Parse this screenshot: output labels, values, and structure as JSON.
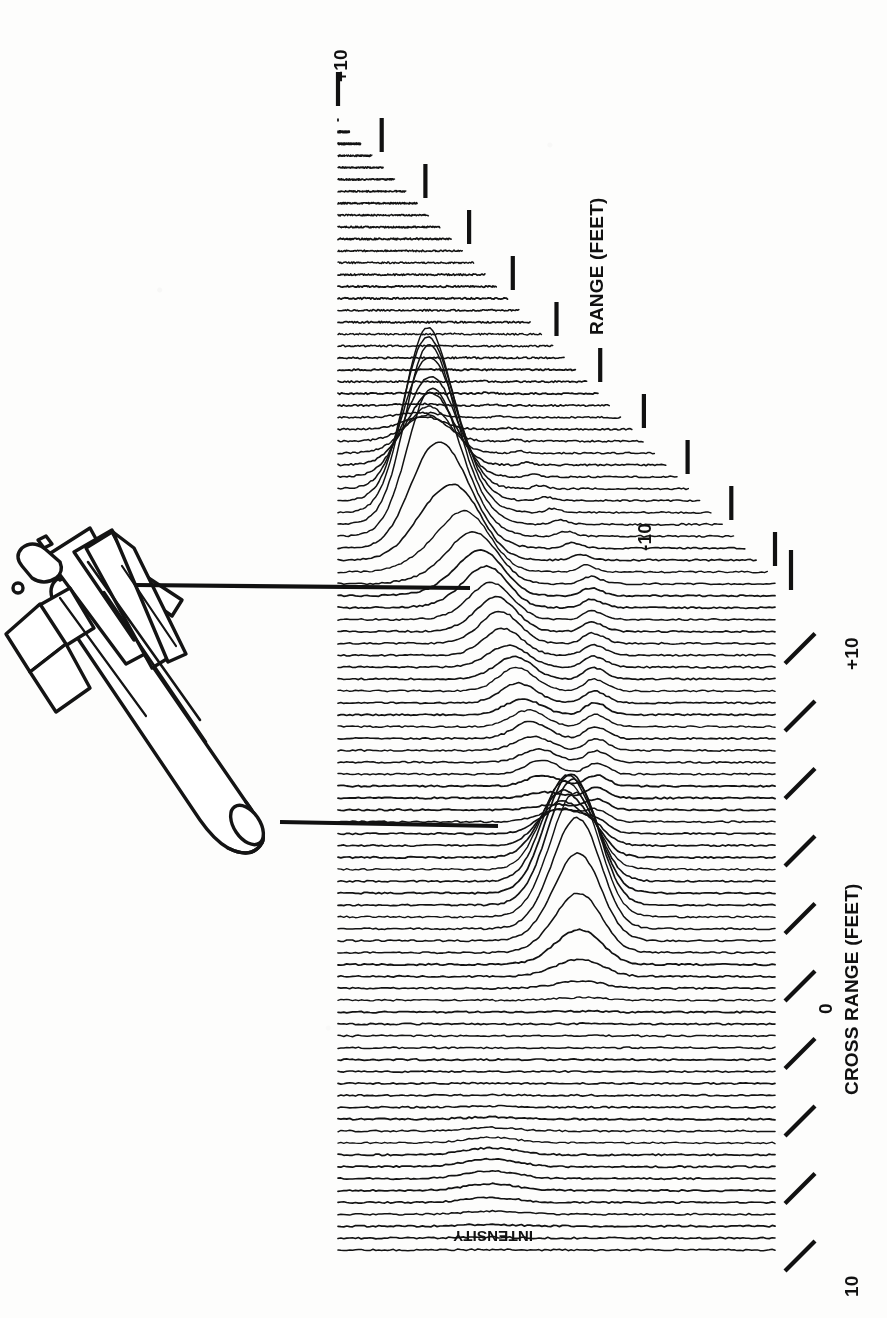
{
  "figure": {
    "kind": "3d-waterfall-surface-plot",
    "orientation_note": "rotated 90 degrees clockwise on the page",
    "ink_color": "#111111",
    "paper_color": "#fdfdfc"
  },
  "axes": {
    "range": {
      "title": "RANGE (FEET)",
      "unit": "FEET",
      "tick_labels": [
        "+10",
        "0",
        "-10"
      ],
      "min": -10,
      "max": 10,
      "tick_count": 11,
      "tick_step": 2
    },
    "cross_range": {
      "title": "CROSS RANGE (FEET)",
      "unit": "FEET",
      "tick_labels": [
        "+10",
        "0",
        "10"
      ],
      "min": -10,
      "max": 10,
      "tick_count": 11,
      "tick_step": 2
    },
    "intensity": {
      "title": "INTENSITY"
    }
  },
  "annotation": {
    "object_name": "missile-outline-drawing",
    "leader_lines": [
      {
        "name": "tail-fin-return-leader",
        "points_to": "fin-assembly-peak"
      },
      {
        "name": "nose-return-leader",
        "points_to": "nose-tip-peak"
      }
    ]
  },
  "chart_data": {
    "type": "line",
    "subtype": "waterfall / stacked profile (3-D surface of radar intensity)",
    "title": "",
    "subtitle": "",
    "xlabel": "CROSS RANGE (FEET)",
    "ylabel": "RANGE (FEET)",
    "zlabel": "INTENSITY",
    "xlim": [
      -10,
      10
    ],
    "ylim": [
      -10,
      10
    ],
    "zlim": [
      0,
      1
    ],
    "grid": false,
    "legend": null,
    "legend_position": "none",
    "x_tick_labels": [
      "+10",
      "0",
      "10"
    ],
    "y_tick_labels": [
      "+10",
      "0",
      "-10"
    ],
    "trace_count": 96,
    "annotations": [
      {
        "text": "+10",
        "axis": "range",
        "value": 10
      },
      {
        "text": "0",
        "axis": "range",
        "value": 0
      },
      {
        "text": "-10",
        "axis": "range",
        "value": -10
      },
      {
        "text": "+10",
        "axis": "cross_range",
        "value": 10
      },
      {
        "text": "0",
        "axis": "cross_range",
        "value": 0
      },
      {
        "text": "10",
        "axis": "cross_range",
        "value": -10
      },
      {
        "text": "INTENSITY",
        "axis": "intensity",
        "value": null
      }
    ],
    "features": [
      {
        "name": "fin-assembly-peak",
        "cross_range": 8.5,
        "range": 5.0,
        "intensity": 0.98
      },
      {
        "name": "secondary-fin-peak",
        "cross_range": 7.6,
        "range": 3.4,
        "intensity": 0.72
      },
      {
        "name": "mid-body-scatter",
        "cross_range": 5.2,
        "range": 1.2,
        "intensity": 0.46
      },
      {
        "name": "body-joint-return",
        "cross_range": 3.0,
        "range": -0.8,
        "intensity": 0.33
      },
      {
        "name": "nose-tip-peak",
        "cross_range": -2.6,
        "range": -2.0,
        "intensity": 0.88
      },
      {
        "name": "noise-floor",
        "cross_range": null,
        "range": null,
        "intensity": 0.03
      }
    ]
  }
}
